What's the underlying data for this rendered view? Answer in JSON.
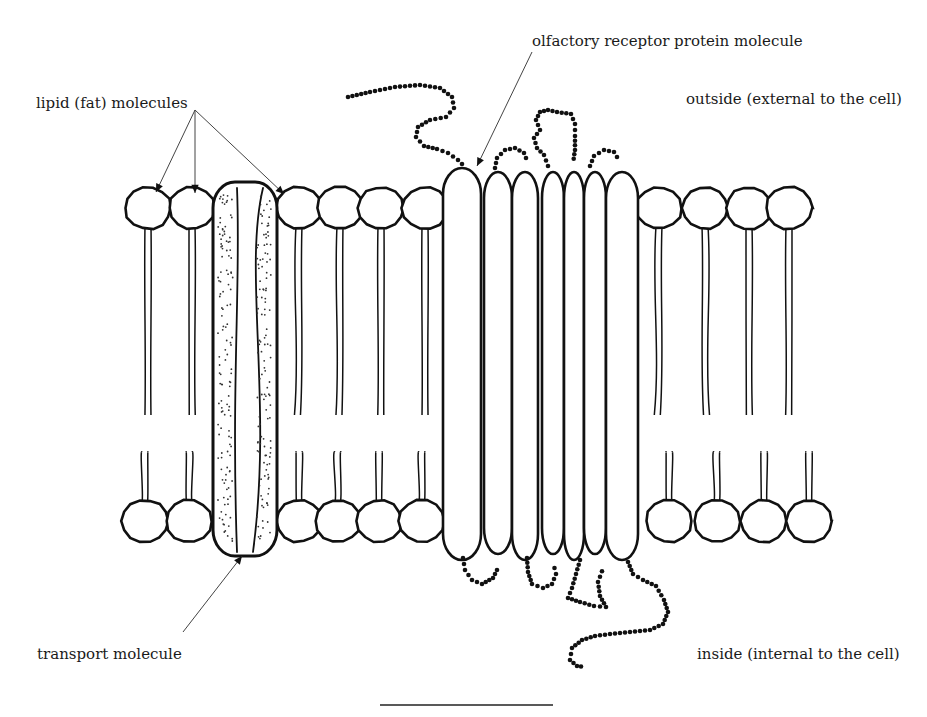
{
  "labels": {
    "lipid": "lipid (fat) molecules",
    "receptor": "olfactory receptor protein molecule",
    "outside": "outside (external to the cell)",
    "inside": "inside (internal to the cell)",
    "transport": "transport molecule"
  },
  "label_positions": {
    "lipid": [
      36,
      96
    ],
    "receptor": [
      532,
      34
    ],
    "outside": [
      686,
      92
    ],
    "inside": [
      697,
      130,
      "bottom"
    ],
    "transport": [
      37,
      132,
      "bottom"
    ]
  },
  "colors": {
    "ink": "#111111",
    "pointer": "#444444",
    "background": "#ffffff"
  },
  "membrane": {
    "top_head_y": 208,
    "bottom_head_y": 521,
    "head_rx": 23,
    "head_ry": 21,
    "top_heads_x": [
      148,
      192,
      299,
      340,
      381,
      425,
      659,
      705,
      749,
      789
    ],
    "bottom_heads_x": [
      145,
      189,
      299,
      338,
      379,
      422,
      669,
      717,
      764,
      809
    ],
    "tail_gap_top": 415,
    "tail_gap_bottom": 452
  },
  "transport_molecule": {
    "x": 213,
    "y": 182,
    "w": 64,
    "h": 374
  },
  "receptor": {
    "helices": [
      {
        "x": 443,
        "w": 38
      },
      {
        "x": 484,
        "w": 28
      },
      {
        "x": 512,
        "w": 26
      },
      {
        "x": 542,
        "w": 22
      },
      {
        "x": 564,
        "w": 20
      },
      {
        "x": 584,
        "w": 22
      },
      {
        "x": 606,
        "w": 32
      }
    ],
    "top_y": 168,
    "bottom_y": 560
  },
  "scale_bar": {
    "x1": 380,
    "x2": 553,
    "y": 705
  }
}
